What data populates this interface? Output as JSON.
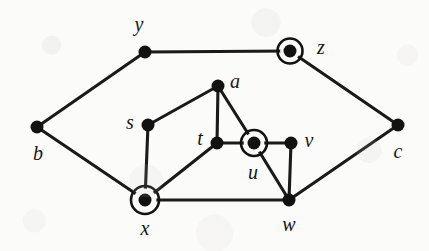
{
  "figure": {
    "kind": "undirected-graph-drawing",
    "background_color": "#fbfbf9",
    "ink_color": "#121212",
    "width": 429,
    "height": 251
  },
  "graph": {
    "nodes": [
      {
        "id": "y",
        "label": "y",
        "x": 145,
        "y": 52,
        "dot_r": 6.5,
        "ringed": false,
        "label_x": 139,
        "label_y": 24
      },
      {
        "id": "z",
        "label": "z",
        "x": 290,
        "y": 51,
        "dot_r": 6.5,
        "ringed": true,
        "ring_r": 12.5,
        "label_x": 321,
        "label_y": 47
      },
      {
        "id": "b",
        "label": "b",
        "x": 37,
        "y": 127,
        "dot_r": 6.5,
        "ringed": false,
        "label_x": 38,
        "label_y": 153
      },
      {
        "id": "c",
        "label": "c",
        "x": 398,
        "y": 125,
        "dot_r": 6.5,
        "ringed": false,
        "label_x": 398,
        "label_y": 151
      },
      {
        "id": "a",
        "label": "a",
        "x": 218,
        "y": 86,
        "dot_r": 6.5,
        "ringed": false,
        "label_x": 235,
        "label_y": 81
      },
      {
        "id": "s",
        "label": "s",
        "x": 148,
        "y": 125,
        "dot_r": 6.5,
        "ringed": false,
        "label_x": 130,
        "label_y": 122
      },
      {
        "id": "t",
        "label": "t",
        "x": 217,
        "y": 143,
        "dot_r": 6.5,
        "ringed": false,
        "label_x": 200,
        "label_y": 138
      },
      {
        "id": "u",
        "label": "u",
        "x": 254,
        "y": 143,
        "dot_r": 6.5,
        "ringed": true,
        "ring_r": 13.0,
        "label_x": 253,
        "label_y": 172
      },
      {
        "id": "v",
        "label": "v",
        "x": 291,
        "y": 143,
        "dot_r": 6.5,
        "ringed": false,
        "label_x": 309,
        "label_y": 140
      },
      {
        "id": "x",
        "label": "x",
        "x": 145,
        "y": 200,
        "dot_r": 6.5,
        "ringed": true,
        "ring_r": 14.0,
        "label_x": 145,
        "label_y": 228
      },
      {
        "id": "w",
        "label": "w",
        "x": 289,
        "y": 200,
        "dot_r": 6.5,
        "ringed": false,
        "label_x": 289,
        "label_y": 224
      }
    ],
    "edges": [
      {
        "from": "y",
        "to": "z"
      },
      {
        "from": "b",
        "to": "y"
      },
      {
        "from": "b",
        "to": "x"
      },
      {
        "from": "z",
        "to": "c"
      },
      {
        "from": "c",
        "to": "w"
      },
      {
        "from": "s",
        "to": "a"
      },
      {
        "from": "s",
        "to": "x"
      },
      {
        "from": "a",
        "to": "t"
      },
      {
        "from": "a",
        "to": "u"
      },
      {
        "from": "t",
        "to": "u"
      },
      {
        "from": "t",
        "to": "x"
      },
      {
        "from": "u",
        "to": "v"
      },
      {
        "from": "u",
        "to": "w"
      },
      {
        "from": "v",
        "to": "w"
      },
      {
        "from": "x",
        "to": "w"
      }
    ],
    "highlighted_nodes": [
      "z",
      "u",
      "x"
    ]
  }
}
